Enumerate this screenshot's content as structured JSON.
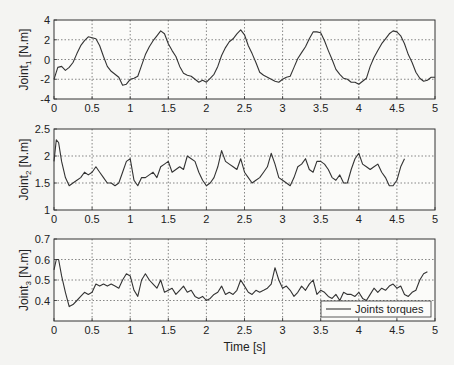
{
  "chart_data": [
    {
      "type": "line",
      "ylabel": "Joint1 [N.m]",
      "ylabel_main": "Joint",
      "ylabel_sub": "1",
      "ylabel_unit": " [N.m]",
      "xlim": [
        0,
        5
      ],
      "ylim": [
        -4,
        4
      ],
      "xticks": [
        "0",
        "0.5",
        "1",
        "1.5",
        "2",
        "2.5",
        "3",
        "3.5",
        "4",
        "4.5",
        "5"
      ],
      "yticks": [
        "-4",
        "-2",
        "0",
        "2",
        "4"
      ],
      "grid": true,
      "series": [
        {
          "name": "Joints torques",
          "x": [
            0,
            0.05,
            0.1,
            0.15,
            0.2,
            0.25,
            0.3,
            0.35,
            0.4,
            0.45,
            0.5,
            0.55,
            0.6,
            0.65,
            0.7,
            0.75,
            0.8,
            0.85,
            0.9,
            0.95,
            1.0,
            1.05,
            1.1,
            1.15,
            1.2,
            1.25,
            1.3,
            1.35,
            1.4,
            1.45,
            1.5,
            1.55,
            1.6,
            1.65,
            1.7,
            1.75,
            1.8,
            1.85,
            1.9,
            1.95,
            2.0,
            2.05,
            2.1,
            2.15,
            2.2,
            2.25,
            2.3,
            2.35,
            2.4,
            2.45,
            2.5,
            2.55,
            2.6,
            2.65,
            2.7,
            2.75,
            2.8,
            2.85,
            2.9,
            2.95,
            3.0,
            3.05,
            3.1,
            3.15,
            3.2,
            3.25,
            3.3,
            3.35,
            3.4,
            3.45,
            3.5,
            3.55,
            3.6,
            3.65,
            3.7,
            3.75,
            3.8,
            3.85,
            3.9,
            3.95,
            4.0,
            4.05,
            4.1,
            4.15,
            4.2,
            4.25,
            4.3,
            4.35,
            4.4,
            4.45,
            4.5,
            4.55,
            4.6,
            4.65,
            4.7,
            4.75,
            4.8,
            4.85,
            4.9,
            4.95,
            5.0
          ],
          "y": [
            -2.0,
            -0.8,
            -0.7,
            -1.1,
            -0.8,
            -0.3,
            0.6,
            1.4,
            1.9,
            2.3,
            2.2,
            2.1,
            1.4,
            0.3,
            -0.7,
            -1.2,
            -1.5,
            -1.8,
            -2.6,
            -2.5,
            -2.0,
            -1.9,
            -1.7,
            -0.6,
            0.5,
            1.3,
            1.9,
            2.4,
            2.9,
            2.6,
            1.6,
            0.9,
            0.3,
            -0.7,
            -1.4,
            -1.6,
            -1.7,
            -2.0,
            -2.3,
            -2.1,
            -2.3,
            -1.9,
            -1.5,
            -0.7,
            0.4,
            1.2,
            1.8,
            2.1,
            2.6,
            3.0,
            2.5,
            1.4,
            0.6,
            -0.3,
            -1.3,
            -1.6,
            -1.8,
            -2.0,
            -2.2,
            -2.3,
            -2.0,
            -1.8,
            -1.7,
            -0.8,
            0.1,
            0.7,
            1.3,
            2.1,
            2.8,
            2.8,
            2.7,
            1.9,
            0.9,
            0.0,
            -1.0,
            -1.5,
            -1.9,
            -2.0,
            -2.3,
            -2.3,
            -2.5,
            -2.2,
            -1.9,
            -0.7,
            0.2,
            0.9,
            1.6,
            2.1,
            2.6,
            2.9,
            2.8,
            2.4,
            1.6,
            0.5,
            -0.3,
            -1.3,
            -1.9,
            -2.2,
            -2.1,
            -1.8,
            -1.8
          ]
        }
      ]
    },
    {
      "type": "line",
      "ylabel": "Joint2 [N.m]",
      "ylabel_main": "Joint",
      "ylabel_sub": "2",
      "ylabel_unit": " [N.m]",
      "xlim": [
        0,
        5
      ],
      "ylim": [
        1,
        2.5
      ],
      "xticks": [
        "0",
        "0.5",
        "1",
        "1.5",
        "2",
        "2.5",
        "3",
        "3.5",
        "4",
        "4.5",
        "5"
      ],
      "yticks": [
        "1",
        "1.5",
        "2",
        "2.5"
      ],
      "grid": true,
      "series": [
        {
          "name": "Joints torques",
          "x": [
            0,
            0.03,
            0.06,
            0.1,
            0.15,
            0.2,
            0.25,
            0.3,
            0.35,
            0.4,
            0.45,
            0.5,
            0.55,
            0.6,
            0.65,
            0.7,
            0.75,
            0.8,
            0.85,
            0.9,
            0.95,
            1.0,
            1.05,
            1.1,
            1.15,
            1.2,
            1.25,
            1.3,
            1.35,
            1.4,
            1.45,
            1.5,
            1.55,
            1.6,
            1.65,
            1.7,
            1.75,
            1.8,
            1.85,
            1.9,
            1.95,
            2.0,
            2.05,
            2.1,
            2.15,
            2.2,
            2.25,
            2.3,
            2.35,
            2.4,
            2.45,
            2.5,
            2.55,
            2.6,
            2.65,
            2.7,
            2.75,
            2.8,
            2.85,
            2.9,
            2.95,
            3.0,
            3.05,
            3.1,
            3.15,
            3.2,
            3.25,
            3.3,
            3.35,
            3.4,
            3.45,
            3.5,
            3.55,
            3.6,
            3.65,
            3.7,
            3.75,
            3.8,
            3.85,
            3.9,
            3.95,
            4.0,
            4.05,
            4.1,
            4.15,
            4.2,
            4.25,
            4.3,
            4.35,
            4.4,
            4.45,
            4.5,
            4.55,
            4.6,
            4.65,
            4.7,
            4.75,
            4.8,
            4.85,
            4.9,
            4.95,
            5.0
          ],
          "y": [
            1.9,
            2.3,
            2.25,
            1.9,
            1.6,
            1.45,
            1.5,
            1.55,
            1.6,
            1.7,
            1.65,
            1.7,
            1.8,
            1.7,
            1.6,
            1.5,
            1.5,
            1.45,
            1.5,
            1.7,
            1.9,
            1.95,
            1.55,
            1.45,
            1.6,
            1.6,
            1.65,
            1.7,
            1.6,
            1.8,
            1.85,
            1.9,
            1.7,
            1.75,
            1.8,
            1.75,
            2.0,
            1.95,
            1.9,
            1.7,
            1.55,
            1.45,
            1.5,
            1.6,
            1.8,
            2.1,
            1.9,
            1.85,
            1.8,
            1.75,
            1.95,
            1.7,
            1.6,
            1.5,
            1.55,
            1.6,
            1.7,
            1.8,
            2.05,
            1.85,
            1.6,
            1.55,
            1.5,
            1.45,
            1.6,
            1.8,
            1.85,
            1.95,
            1.75,
            1.7,
            1.9,
            1.9,
            1.85,
            1.75,
            1.6,
            1.55,
            1.65,
            1.5,
            1.5,
            1.75,
            1.95,
            2.05,
            1.85,
            1.8,
            1.75,
            1.8,
            1.85,
            1.7,
            1.6,
            1.45,
            1.45,
            1.55,
            1.8,
            1.95
          ]
        }
      ]
    },
    {
      "type": "line",
      "ylabel": "Joint3 [N.m]",
      "ylabel_main": "Joint",
      "ylabel_sub": "3",
      "ylabel_unit": " [N.m]",
      "xlabel": "Time [s]",
      "xlim": [
        0,
        5
      ],
      "ylim": [
        0.3,
        0.7
      ],
      "xticks": [
        "0",
        "0.5",
        "1",
        "1.5",
        "2",
        "2.5",
        "3",
        "3.5",
        "4",
        "4.5",
        "5"
      ],
      "yticks": [
        "0.4",
        "0.5",
        "0.6",
        "0.7"
      ],
      "grid": true,
      "legend": {
        "entries": [
          "Joints torques"
        ],
        "position": "lower right"
      },
      "series": [
        {
          "name": "Joints torques",
          "x": [
            0,
            0.03,
            0.06,
            0.1,
            0.15,
            0.2,
            0.25,
            0.3,
            0.35,
            0.4,
            0.45,
            0.5,
            0.55,
            0.6,
            0.65,
            0.7,
            0.75,
            0.8,
            0.85,
            0.9,
            0.95,
            1.0,
            1.05,
            1.1,
            1.15,
            1.2,
            1.25,
            1.3,
            1.35,
            1.4,
            1.45,
            1.5,
            1.55,
            1.6,
            1.65,
            1.7,
            1.75,
            1.8,
            1.85,
            1.9,
            1.95,
            2.0,
            2.05,
            2.1,
            2.15,
            2.2,
            2.25,
            2.3,
            2.35,
            2.4,
            2.45,
            2.5,
            2.55,
            2.6,
            2.65,
            2.7,
            2.75,
            2.8,
            2.85,
            2.9,
            2.95,
            3.0,
            3.05,
            3.1,
            3.15,
            3.2,
            3.25,
            3.3,
            3.35,
            3.4,
            3.45,
            3.5,
            3.55,
            3.6,
            3.65,
            3.7,
            3.75,
            3.8,
            3.85,
            3.9,
            3.95,
            4.0,
            4.05,
            4.1,
            4.15,
            4.2,
            4.25,
            4.3,
            4.35,
            4.4,
            4.45,
            4.5,
            4.55,
            4.6,
            4.65,
            4.7,
            4.75,
            4.8,
            4.85,
            4.9,
            4.95,
            5.0
          ],
          "y": [
            0.55,
            0.6,
            0.6,
            0.52,
            0.44,
            0.37,
            0.38,
            0.4,
            0.42,
            0.44,
            0.43,
            0.44,
            0.48,
            0.47,
            0.48,
            0.47,
            0.48,
            0.47,
            0.46,
            0.5,
            0.53,
            0.52,
            0.45,
            0.42,
            0.5,
            0.53,
            0.5,
            0.48,
            0.46,
            0.5,
            0.44,
            0.45,
            0.46,
            0.43,
            0.45,
            0.47,
            0.44,
            0.45,
            0.42,
            0.41,
            0.42,
            0.4,
            0.41,
            0.43,
            0.44,
            0.47,
            0.43,
            0.44,
            0.43,
            0.45,
            0.5,
            0.47,
            0.44,
            0.43,
            0.45,
            0.44,
            0.45,
            0.46,
            0.48,
            0.56,
            0.5,
            0.46,
            0.47,
            0.45,
            0.42,
            0.44,
            0.47,
            0.45,
            0.48,
            0.5,
            0.43,
            0.45,
            0.44,
            0.42,
            0.41,
            0.43,
            0.4,
            0.44,
            0.43,
            0.43,
            0.42,
            0.44,
            0.41,
            0.4,
            0.43,
            0.46,
            0.44,
            0.46,
            0.45,
            0.47,
            0.48,
            0.46,
            0.47,
            0.43,
            0.42,
            0.44,
            0.45,
            0.5,
            0.53,
            0.54
          ]
        }
      ]
    }
  ]
}
